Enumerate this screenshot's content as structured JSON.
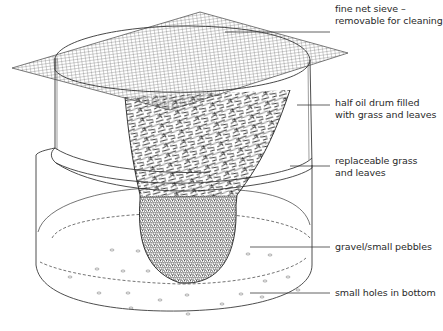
{
  "diagram": {
    "labels": [
      {
        "id": "sieve",
        "line1": "fine net sieve –",
        "line2": "removable for cleaning",
        "x": 335,
        "y": 3,
        "leader_from": [
          225,
          32
        ],
        "leader_to": [
          330,
          32
        ]
      },
      {
        "id": "drum",
        "line1": "half oil drum filled",
        "line2": "with grass and leaves",
        "x": 335,
        "y": 97,
        "leader_from": [
          297,
          105
        ],
        "leader_to": [
          330,
          105
        ]
      },
      {
        "id": "grass",
        "line1": "replaceable grass",
        "line2": "and leaves",
        "x": 335,
        "y": 155,
        "leader_from": [
          290,
          166
        ],
        "leader_to": [
          330,
          166
        ]
      },
      {
        "id": "gravel",
        "line1": "gravel/small pebbles",
        "line2": "",
        "x": 335,
        "y": 226,
        "leader_from": [
          250,
          247
        ],
        "leader_to": [
          330,
          247
        ]
      },
      {
        "id": "holes",
        "line1": "small holes in bottom",
        "line2": "",
        "x": 335,
        "y": 273,
        "leader_from": [
          250,
          293
        ],
        "leader_to": [
          330,
          293
        ]
      }
    ],
    "colors": {
      "line": "#3a3a3a",
      "mesh": "#555555",
      "text": "#2a2a2a",
      "background": "#ffffff"
    }
  }
}
